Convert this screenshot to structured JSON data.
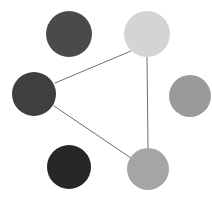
{
  "canvas": {
    "width": 212,
    "height": 201,
    "background": "#ffffff",
    "title": "node-link-graph"
  },
  "chart_data": {
    "type": "scatter",
    "title": "",
    "subtitle": "",
    "xlabel": "",
    "ylabel": "",
    "grid": false,
    "legend": "none",
    "axes_visible": false,
    "tick_labels": [],
    "annotations": [],
    "xlim": [
      0,
      212
    ],
    "ylim": [
      0,
      201
    ],
    "nodes": [
      {
        "id": "n1",
        "label": "",
        "cx": 69,
        "cy": 34,
        "r": 23,
        "color": "#4a4a4c",
        "shape": "circle",
        "degree": 0,
        "position": "top-left"
      },
      {
        "id": "n2",
        "label": "",
        "cx": 147,
        "cy": 34,
        "r": 23,
        "color": "#d4d4d4",
        "shape": "circle",
        "degree": 2,
        "position": "top-right"
      },
      {
        "id": "n3",
        "label": "",
        "cx": 34,
        "cy": 94,
        "r": 22,
        "color": "#3f3f41",
        "shape": "circle",
        "degree": 2,
        "position": "left"
      },
      {
        "id": "n4",
        "label": "",
        "cx": 190,
        "cy": 96,
        "r": 21,
        "color": "#9a9a9a",
        "shape": "circle",
        "degree": 0,
        "position": "right"
      },
      {
        "id": "n5",
        "label": "",
        "cx": 69,
        "cy": 167,
        "r": 22,
        "color": "#262628",
        "shape": "circle",
        "degree": 0,
        "position": "bottom-left"
      },
      {
        "id": "n6",
        "label": "",
        "cx": 148,
        "cy": 169,
        "r": 21,
        "color": "#a5a5a5",
        "shape": "circle",
        "degree": 2,
        "position": "bottom-center"
      }
    ],
    "edges": [
      {
        "id": "e1",
        "source": "n3",
        "target": "n2",
        "x1": 55,
        "y1": 83,
        "x2": 131,
        "y2": 51,
        "color": "#6e6e70",
        "width": 1
      },
      {
        "id": "e2",
        "source": "n3",
        "target": "n6",
        "x1": 54,
        "y1": 106,
        "x2": 131,
        "y2": 158,
        "color": "#6e6e70",
        "width": 1
      },
      {
        "id": "e3",
        "source": "n2",
        "target": "n6",
        "x1": 147,
        "y1": 57,
        "x2": 148,
        "y2": 148,
        "color": "#6e6e70",
        "width": 1
      }
    ]
  }
}
